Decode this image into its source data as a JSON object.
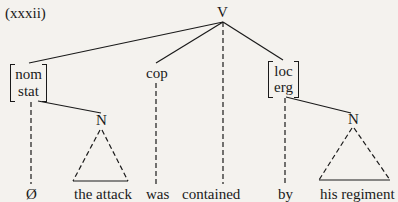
{
  "example_number": "(xxxii)",
  "root": {
    "label": "V"
  },
  "nodes": {
    "nom_stat": {
      "features": [
        "nom",
        "stat"
      ]
    },
    "cop": {
      "label": "cop"
    },
    "loc_erg": {
      "features": [
        "loc",
        "erg"
      ]
    },
    "n_left": {
      "label": "N"
    },
    "n_right": {
      "label": "N"
    }
  },
  "leaves": [
    {
      "id": "null",
      "text": "Ø"
    },
    {
      "id": "the_attack",
      "text": "the attack"
    },
    {
      "id": "was",
      "text": "was"
    },
    {
      "id": "contained",
      "text": "contained"
    },
    {
      "id": "by",
      "text": "by"
    },
    {
      "id": "his_regiment",
      "text": "his regiment"
    }
  ],
  "colors": {
    "ink": "#1a1a1a",
    "paper": "#f4f2ee"
  }
}
